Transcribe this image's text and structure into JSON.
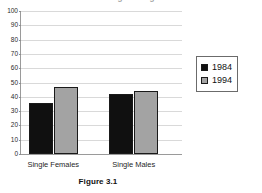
{
  "figure": {
    "caption": "Figure 3.1",
    "cropped_title": "Percentage Living Alone"
  },
  "legend": {
    "position": "right",
    "entries": [
      {
        "label": "1984",
        "color": "#101010"
      },
      {
        "label": "1994",
        "color": "#a3a3a3"
      }
    ]
  },
  "colors": {
    "series_1984": "#101010",
    "series_1994": "#a3a3a3",
    "gridline": "#d9d9d9",
    "axis": "#9a9a9a",
    "bar_outline": "#1a1a1a",
    "background": "#ffffff"
  },
  "chart_data": {
    "type": "bar",
    "title": "",
    "xlabel": "",
    "ylabel": "",
    "categories": [
      "Single Females",
      "Single Males"
    ],
    "series": [
      {
        "name": "1984",
        "values": [
          36,
          42
        ]
      },
      {
        "name": "1994",
        "values": [
          47,
          44
        ]
      }
    ],
    "ylim": [
      0,
      100
    ],
    "ytick_labels": [
      "0",
      "10",
      "20",
      "30",
      "40",
      "50",
      "60",
      "70",
      "80",
      "90",
      "100"
    ],
    "ytick_values": [
      0,
      10,
      20,
      30,
      40,
      50,
      60,
      70,
      80,
      90,
      100
    ],
    "grid": true,
    "grid_axis": "y",
    "legend_position": "right"
  }
}
